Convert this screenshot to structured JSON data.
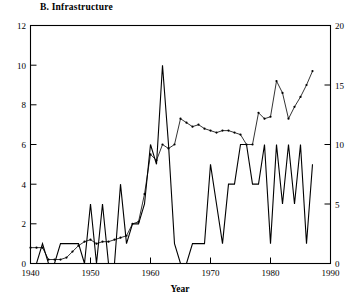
{
  "figure": {
    "title": "B. Infrastructure",
    "background_color": "#ffffff",
    "line_color": "#000000"
  },
  "axes": {
    "xlabel": "Year",
    "x_ticks": [
      "1940",
      "1950",
      "1960",
      "1970",
      "1980",
      "1990"
    ],
    "y_left_ticks": [
      "0",
      "2",
      "4",
      "6",
      "8",
      "10",
      "12"
    ],
    "y_right_ticks": [
      "0",
      "5",
      "10",
      "15",
      "20"
    ]
  },
  "chart_data": {
    "type": "line",
    "title": "B. Infrastructure",
    "xlabel": "Year",
    "ylabel": "",
    "ylabel_right": "",
    "xlim": [
      1940,
      1990
    ],
    "ylim": [
      0,
      12
    ],
    "ylim_right": [
      0,
      20
    ],
    "grid": false,
    "legend": "none",
    "x_ticks": [
      1940,
      1950,
      1960,
      1970,
      1980,
      1990
    ],
    "y_left_ticks": [
      0,
      2,
      4,
      6,
      8,
      10,
      12
    ],
    "y_right_ticks": [
      0,
      5,
      10,
      15,
      20
    ],
    "series": [
      {
        "name": "annual-count",
        "axis": "left",
        "style": "solid-line",
        "markers": false,
        "x": [
          1940,
          1941,
          1942,
          1943,
          1944,
          1945,
          1946,
          1947,
          1948,
          1949,
          1950,
          1951,
          1952,
          1953,
          1954,
          1955,
          1956,
          1957,
          1958,
          1959,
          1960,
          1961,
          1962,
          1963,
          1964,
          1965,
          1966,
          1967,
          1968,
          1969,
          1970,
          1971,
          1972,
          1973,
          1974,
          1975,
          1976,
          1977,
          1978,
          1979,
          1980,
          1981,
          1982,
          1983,
          1984,
          1985,
          1986,
          1987
        ],
        "values": [
          0,
          0,
          1,
          0,
          0,
          1,
          1,
          1,
          1,
          0,
          3,
          0,
          3,
          0,
          0,
          4,
          1,
          2,
          2,
          3,
          6,
          5,
          10,
          6,
          1,
          0,
          0,
          1,
          1,
          1,
          5,
          3,
          1,
          4,
          4,
          6,
          6,
          4,
          4,
          6,
          1,
          6,
          3,
          6,
          3,
          6,
          1,
          5
        ]
      },
      {
        "name": "cumulative-index",
        "axis": "right",
        "style": "line-with-dots",
        "markers": true,
        "x": [
          1940,
          1941,
          1942,
          1943,
          1944,
          1945,
          1946,
          1947,
          1948,
          1949,
          1950,
          1951,
          1952,
          1953,
          1954,
          1955,
          1956,
          1957,
          1958,
          1959,
          1960,
          1961,
          1962,
          1963,
          1964,
          1965,
          1966,
          1967,
          1968,
          1969,
          1970,
          1971,
          1972,
          1973,
          1974,
          1975,
          1976,
          1977,
          1978,
          1979,
          1980,
          1981,
          1982,
          1983,
          1984,
          1985,
          1986,
          1987
        ],
        "values_left_scale": [
          0.8,
          0.8,
          0.8,
          0.2,
          0.2,
          0.2,
          0.3,
          0.6,
          0.9,
          1.1,
          1.2,
          1.0,
          1.1,
          1.1,
          1.2,
          1.3,
          1.4,
          2.0,
          2.1,
          3.5,
          5.5,
          5.2,
          6.0,
          5.8,
          6.0,
          7.3,
          7.1,
          6.9,
          7.0,
          6.8,
          6.7,
          6.6,
          6.7,
          6.7,
          6.6,
          6.5,
          6.0,
          6.0,
          7.6,
          7.3,
          7.4,
          9.2,
          8.6,
          7.3,
          7.9,
          8.4,
          9.0,
          9.7
        ],
        "values_right_scale": [
          1.33,
          1.33,
          1.33,
          0.33,
          0.33,
          0.33,
          0.5,
          1.0,
          1.5,
          1.83,
          2.0,
          1.67,
          1.83,
          1.83,
          2.0,
          2.17,
          2.33,
          3.33,
          3.5,
          5.83,
          9.17,
          8.67,
          10.0,
          9.67,
          10.0,
          12.17,
          11.83,
          11.5,
          11.67,
          11.33,
          11.17,
          11.0,
          11.17,
          11.17,
          11.0,
          10.83,
          10.0,
          10.0,
          12.67,
          12.17,
          12.33,
          15.33,
          14.33,
          12.17,
          13.17,
          14.0,
          15.0,
          16.17
        ]
      }
    ]
  }
}
